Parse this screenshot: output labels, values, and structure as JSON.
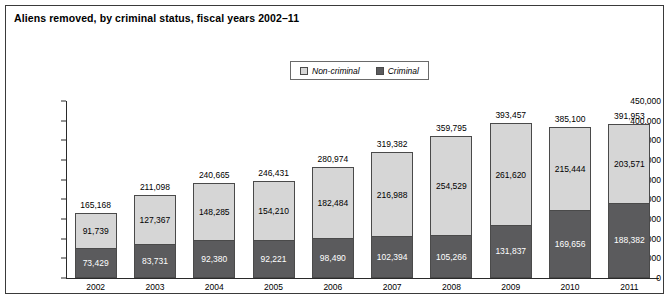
{
  "figure": {
    "title": "Aliens removed, by criminal status, fiscal years 2002–11"
  },
  "legend": {
    "position": "top-center",
    "items": [
      {
        "label": "Non-criminal",
        "color": "#d6d6d6",
        "icon": "legend-swatch"
      },
      {
        "label": "Criminal",
        "color": "#5b5b5d",
        "icon": "legend-swatch"
      }
    ]
  },
  "axes": {
    "y_ticks": [
      "450,000",
      "400,000",
      "350,000",
      "300,000",
      "250,000",
      "200,000",
      "150,000",
      "100,000",
      "50,000",
      "0"
    ],
    "x_labels": [
      "2002",
      "2003",
      "2004",
      "2005",
      "2006",
      "2007",
      "2008",
      "2009",
      "2010",
      "2011"
    ]
  },
  "chart_data": {
    "type": "bar",
    "subtype": "stacked-column",
    "title": "Aliens removed, by criminal status, fiscal years 2002–11",
    "xlabel": "",
    "ylabel": "",
    "ylim": [
      0,
      450000
    ],
    "ytick_interval": 50000,
    "grid": false,
    "legend_position": "top-center",
    "categories": [
      "2002",
      "2003",
      "2004",
      "2005",
      "2006",
      "2007",
      "2008",
      "2009",
      "2010",
      "2011"
    ],
    "series": [
      {
        "name": "Criminal",
        "color": "#5b5b5d",
        "values": [
          73429,
          83731,
          92380,
          92221,
          98490,
          102394,
          105266,
          131837,
          169656,
          188382
        ],
        "labels": [
          "73,429",
          "83,731",
          "92,380",
          "92,221",
          "98,490",
          "102,394",
          "105,266",
          "131,837",
          "169,656",
          "188,382"
        ]
      },
      {
        "name": "Non-criminal",
        "color": "#d6d6d6",
        "values": [
          91739,
          127367,
          148285,
          154210,
          182484,
          216988,
          254529,
          261620,
          215444,
          203571
        ],
        "labels": [
          "91,739",
          "127,367",
          "148,285",
          "154,210",
          "182,484",
          "216,988",
          "254,529",
          "261,620",
          "215,444",
          "203,571"
        ]
      }
    ],
    "totals": [
      165168,
      211098,
      240665,
      246431,
      280974,
      319382,
      359795,
      393457,
      385100,
      391953
    ],
    "total_labels": [
      "165,168",
      "211,098",
      "240,665",
      "246,431",
      "280,974",
      "319,382",
      "359,795",
      "393,457",
      "385,100",
      "391,953"
    ]
  }
}
